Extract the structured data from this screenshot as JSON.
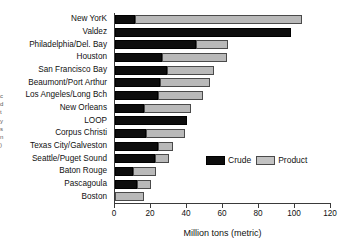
{
  "margin_note": "c\nd\nt\ny\ns\nn\n)",
  "legend": {
    "position": "inside-bottom-right",
    "entries": [
      {
        "label": "Crude",
        "color": "#0d0d0d",
        "icon": "legend-swatch-icon"
      },
      {
        "label": "Product",
        "color": "#c2c2c2",
        "icon": "legend-swatch-icon"
      }
    ]
  },
  "chart_data": {
    "type": "bar",
    "orientation": "horizontal",
    "stacked": true,
    "title": "",
    "xlabel": "Million tons (metric)",
    "ylabel": "",
    "xlim": [
      0,
      120
    ],
    "xticks": [
      0,
      20,
      40,
      60,
      80,
      100,
      120
    ],
    "xticklabels": [
      "0",
      "20",
      "40",
      "60",
      "80",
      "100",
      "120"
    ],
    "grid": false,
    "legend_position": "inside-bottom-right",
    "categories": [
      "New YorK",
      "Valdez",
      "Philadelphia/Del. Bay",
      "Houston",
      "San Francisco Bay",
      "Beaumont/Port Arthur",
      "Los Angeles/Long Bch",
      "New Orleans",
      "LOOP",
      "Corpus Christi",
      "Texas City/Galveston",
      "Seattle/Puget Sound",
      "Baton Rouge",
      "Pascagoula",
      "Boston"
    ],
    "series": [
      {
        "name": "Crude",
        "color": "#0d0d0d",
        "values": [
          11,
          98,
          45,
          26,
          29,
          25,
          24,
          16,
          40,
          17,
          24,
          22,
          10,
          12,
          0
        ]
      },
      {
        "name": "Product",
        "color": "#c2c2c2",
        "values": [
          93,
          0,
          18,
          36,
          26,
          28,
          25,
          26,
          0,
          22,
          8,
          8,
          13,
          8,
          16
        ]
      }
    ],
    "totals": [
      104,
      98,
      63,
      62,
      55,
      53,
      49,
      42,
      40,
      39,
      32,
      30,
      23,
      20,
      16
    ]
  }
}
